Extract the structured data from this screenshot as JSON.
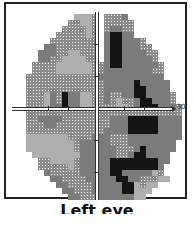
{
  "figure": {
    "caption": "Left eye",
    "axis_label_right": "30"
  },
  "legend": {
    "levels": [
      {
        "code": ".",
        "name": "blank"
      },
      {
        "code": "1",
        "name": "light-dotted",
        "color": "#f2f2f2"
      },
      {
        "code": "2",
        "name": "crosshatch",
        "color": "#8c8c8c"
      },
      {
        "code": "3",
        "name": "medium-gray",
        "color": "#7b7b7b"
      },
      {
        "code": "4",
        "name": "dark",
        "color": "#3a3a3a"
      }
    ]
  },
  "grid": {
    "cell_px": 6,
    "origin": [
      14,
      14
    ],
    "rows": [
      "..........1112.2223.........",
      ".........22112.22222........",
      "........222212.23322........",
      ".......2222212.34433........",
      "......22222222.3443332......",
      ".....332222222.34433322.....",
      "....3332211222.344333322....",
      "....3322111122.344333332....",
      "...2222111111223443333332...",
      "...2222111111223333333322...",
      "..22222222222233333333333...",
      "..222222222222233333433333..",
      "..222222222222233333443333..",
      "..2221324331122322334433332.",
      "..2221324331122321223443332.",
      "..22213343311222211234443332",
      "..22222222222222222222222222",
      "..22333322222222333444443333",
      "..22233222222222333444443333",
      "..22222222222223333444443333",
      "..11111112222333222333333333",
      "..1111111123333322233333333.",
      "..1111111123333332223433333.",
      "...11111111333333223443333..",
      "....2211112333334444444433..",
      "....222221233333444444443...",
      ".....32222233333443333312...",
      "......33222233333443322211..",
      ".......33222233333441211....",
      "........332223333344111.....",
      ".........3322233333311......"
    ]
  },
  "ticks": {
    "horizontal_x": [
      48,
      68,
      124,
      144
    ],
    "vertical_y": [
      44,
      76,
      140,
      172
    ]
  }
}
